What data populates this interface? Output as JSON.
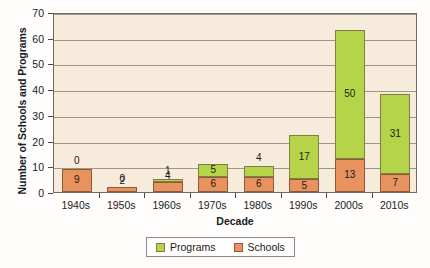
{
  "chart_data": {
    "type": "bar",
    "subtype": "stacked-column",
    "title": "",
    "xlabel": "Decade",
    "ylabel": "Number of Schools and Programs",
    "categories": [
      "1940s",
      "1950s",
      "1960s",
      "1970s",
      "1980s",
      "1990s",
      "2000s",
      "2010s"
    ],
    "series": [
      {
        "name": "Programs",
        "color": "#b5d44a",
        "values": [
          0,
          0,
          1,
          5,
          4,
          17,
          50,
          31
        ]
      },
      {
        "name": "Schools",
        "color": "#e8925e",
        "values": [
          9,
          2,
          4,
          6,
          6,
          5,
          13,
          7
        ]
      }
    ],
    "totals": [
      9,
      2,
      5,
      11,
      10,
      22,
      63,
      38
    ],
    "ylim": [
      0,
      70
    ],
    "yticks": [
      0,
      10,
      20,
      30,
      40,
      50,
      60,
      70
    ],
    "ytick_labels": [
      "0",
      "10",
      "20",
      "30",
      "40",
      "50",
      "60",
      "70"
    ],
    "grid": true,
    "grid_axis": "y",
    "legend_position": "bottom",
    "stack_order": [
      "Schools",
      "Programs"
    ],
    "data_labels": true,
    "plot_background": "#f7ebdc",
    "grid_color": "#9d968c",
    "axis_color": "#6f6a63"
  },
  "legend": {
    "items": [
      {
        "label": "Programs",
        "swatch": "programs-swatch"
      },
      {
        "label": "Schools",
        "swatch": "schools-swatch"
      }
    ]
  },
  "bars": [
    {
      "category": "1940s",
      "schools": "9",
      "programs": "0",
      "programs_zero": true
    },
    {
      "category": "1950s",
      "schools": "2",
      "programs": "0",
      "programs_zero": true
    },
    {
      "category": "1960s",
      "schools": "4",
      "programs": "1",
      "programs_zero": false
    },
    {
      "category": "1970s",
      "schools": "6",
      "programs": "5",
      "programs_zero": false
    },
    {
      "category": "1980s",
      "schools": "6",
      "programs": "4",
      "programs_zero": false
    },
    {
      "category": "1990s",
      "schools": "5",
      "programs": "17",
      "programs_zero": false
    },
    {
      "category": "2000s",
      "schools": "13",
      "programs": "50",
      "programs_zero": false
    },
    {
      "category": "2010s",
      "schools": "7",
      "programs": "31",
      "programs_zero": false
    }
  ]
}
